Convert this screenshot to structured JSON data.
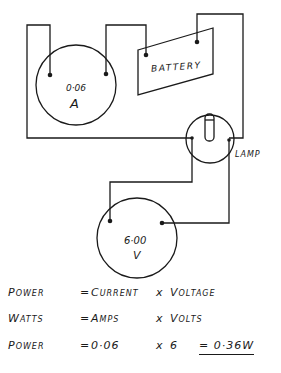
{
  "diagram": {
    "components": {
      "ammeter": {
        "reading": "0·06",
        "unit": "A"
      },
      "battery": {
        "label": "Battery"
      },
      "lamp": {
        "label": "Lamp"
      },
      "voltmeter": {
        "reading": "6·00",
        "unit": "V"
      }
    },
    "colors": {
      "ink": "#1a1a1a",
      "background": "#ffffff"
    }
  },
  "equations": [
    {
      "label": "Power",
      "eq": "=",
      "first": "Current",
      "op": "x",
      "second": "Voltage",
      "result": ""
    },
    {
      "label": "Watts",
      "eq": "=",
      "first": "Amps",
      "op": "x",
      "second": "Volts",
      "result": ""
    },
    {
      "label": "Power",
      "eq": "=",
      "first": "0·06",
      "op": "x",
      "second": "6",
      "result": "= 0·36W"
    }
  ]
}
